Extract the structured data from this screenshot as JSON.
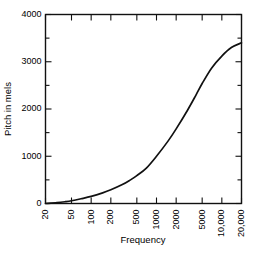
{
  "chart_data": {
    "type": "line",
    "title": "",
    "xlabel": "Frequency",
    "ylabel": "Pitch in mels",
    "xscale": "log",
    "yscale": "linear",
    "xlim": [
      20,
      20000
    ],
    "ylim": [
      0,
      4000
    ],
    "grid": false,
    "legend": null,
    "xticks": [
      20,
      50,
      100,
      200,
      500,
      1000,
      2000,
      5000,
      10000,
      20000
    ],
    "xtick_labels": [
      "20",
      "50",
      "100",
      "200",
      "500",
      "1000",
      "2000",
      "5000",
      "10,000",
      "20,000"
    ],
    "yticks": [
      0,
      1000,
      2000,
      3000,
      4000
    ],
    "ytick_labels": [
      "0",
      "1000",
      "2000",
      "3000",
      "4000"
    ],
    "yminor_ticks": [
      500,
      1500,
      2500,
      3500
    ],
    "series": [
      {
        "name": "mel scale",
        "color": "#111111",
        "x": [
          20,
          30,
          40,
          50,
          70,
          100,
          150,
          200,
          300,
          400,
          500,
          700,
          1000,
          1500,
          2000,
          3000,
          4000,
          5000,
          7000,
          10000,
          14000,
          20000
        ],
        "y": [
          0,
          18,
          38,
          58,
          100,
          150,
          225,
          290,
          400,
          500,
          590,
          750,
          1000,
          1320,
          1580,
          1980,
          2290,
          2540,
          2870,
          3120,
          3300,
          3400
        ]
      }
    ],
    "annotations": []
  },
  "axis_titles": {
    "x": "Frequency",
    "y": "Pitch in mels"
  }
}
